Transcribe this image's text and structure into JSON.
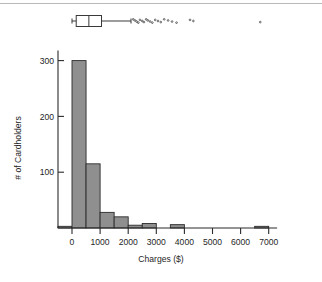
{
  "figure": {
    "name": "charges-histogram-with-boxplot",
    "background_color": "#ffffff",
    "rule_color": "#b9b9b9"
  },
  "chart_data": {
    "type": "bar",
    "title": "",
    "subtitle": "",
    "xlabel": "Charges ($)",
    "ylabel": "# of Cardholders",
    "xlim": [
      -700,
      7300
    ],
    "ylim": [
      0,
      320
    ],
    "grid": false,
    "legend": "none",
    "bin_width": 500,
    "bar_fill": "#8f8f8f",
    "bar_edge": "#2b2b2b",
    "axis_color": "#2b2b2b",
    "xticks": [
      0,
      1000,
      2000,
      3000,
      4000,
      5000,
      6000,
      7000
    ],
    "xticklabels": [
      "0",
      "1000",
      "2000",
      "3000",
      "4000",
      "5000",
      "6000",
      "7000"
    ],
    "yticks": [
      100,
      200,
      300
    ],
    "yticklabels": [
      "100",
      "200",
      "300"
    ],
    "bin_edges": [
      -500,
      0,
      500,
      1000,
      1500,
      2000,
      2500,
      3000,
      3500,
      4000,
      4500,
      5000,
      5500,
      6000,
      6500,
      7000
    ],
    "categories": [
      "-500-0",
      "0-500",
      "500-1000",
      "1000-1500",
      "1500-2000",
      "2000-2500",
      "2500-3000",
      "3000-3500",
      "3500-4000",
      "4000-4500",
      "4500-5000",
      "5000-5500",
      "5500-6000",
      "6000-6500",
      "6500-7000"
    ],
    "values": [
      3,
      300,
      115,
      28,
      20,
      5,
      8,
      0,
      6,
      0,
      0,
      0,
      0,
      0,
      3
    ]
  },
  "boxplot": {
    "name": "charges-boxplot",
    "orientation": "horizontal",
    "whisker_low": 0,
    "q1": 150,
    "median": 600,
    "q3": 1050,
    "whisker_high": 2100,
    "box_fill": "#ffffff",
    "box_edge": "#3a3a3a",
    "outliers": [
      2180,
      2240,
      2300,
      2360,
      2420,
      2500,
      2560,
      2640,
      2700,
      2780,
      2860,
      2960,
      3060,
      3160,
      3280,
      3420,
      3560,
      3720,
      4200,
      4320,
      6700
    ]
  }
}
